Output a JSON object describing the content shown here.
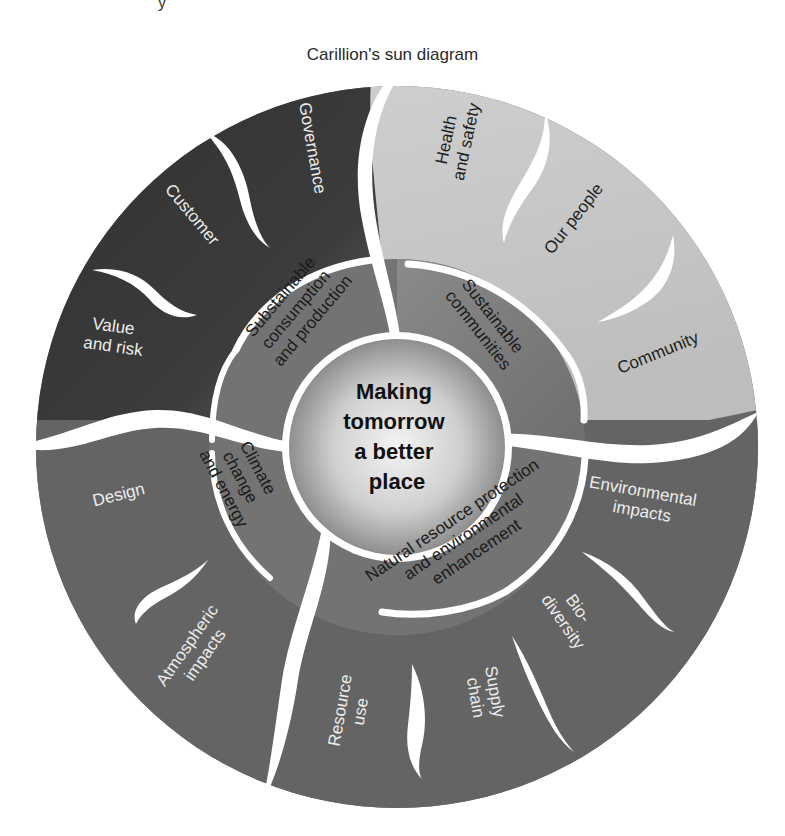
{
  "title": "Carillion's sun diagram",
  "top_fragment": "y",
  "center": {
    "lines": [
      "Making",
      "tomorrow",
      "a better",
      "place"
    ]
  },
  "inner_ring": {
    "top_left": {
      "lines": [
        "Substainable",
        "consumption",
        "and production"
      ]
    },
    "top_right": {
      "lines": [
        "Sustainable",
        "communities"
      ]
    },
    "bottom_left": {
      "lines": [
        "Climate",
        "change",
        "and energy"
      ]
    },
    "bottom_right": {
      "lines": [
        "Natural resource protection",
        "and environmental",
        "enhancement"
      ]
    }
  },
  "outer_ring": {
    "top_left": [
      {
        "lines": [
          "Governance"
        ]
      },
      {
        "lines": [
          "Customer"
        ]
      },
      {
        "lines": [
          "Value",
          "and risk"
        ]
      }
    ],
    "top_right": [
      {
        "lines": [
          "Health",
          "and safety"
        ]
      },
      {
        "lines": [
          "Our people"
        ]
      },
      {
        "lines": [
          "Community"
        ]
      }
    ],
    "bottom_left": [
      {
        "lines": [
          "Design"
        ]
      },
      {
        "lines": [
          "Atmospheric",
          "impacts"
        ]
      }
    ],
    "bottom_right": [
      {
        "lines": [
          "Environmental",
          "impacts"
        ]
      },
      {
        "lines": [
          "Bio-",
          "diversity"
        ]
      },
      {
        "lines": [
          "Supply",
          "chain"
        ]
      },
      {
        "lines": [
          "Resource",
          "use"
        ]
      }
    ]
  },
  "colors": {
    "dark_quadrant": "#3a3a3a",
    "light_quadrant": "#c9c9c9",
    "mid_quadrant": "#6b6b6b",
    "inner_ring": "#7a7a7a",
    "center_light": "#f2f2f2",
    "center_dark": "#9a9a9a",
    "separator": "#ffffff"
  }
}
